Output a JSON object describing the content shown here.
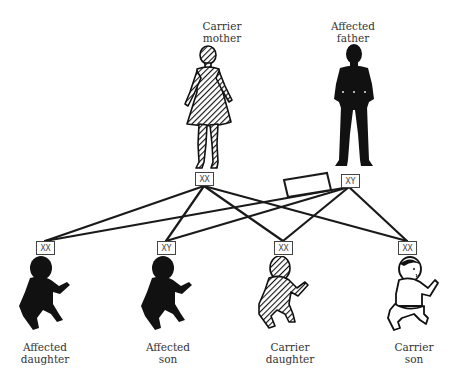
{
  "diagram": {
    "parents": [
      {
        "id": "mother",
        "label_line1": "Carrier",
        "label_line2": "mother",
        "genotype": "XX",
        "status": "carrier",
        "fill": "hatched"
      },
      {
        "id": "father",
        "label_line1": "Affected",
        "label_line2": "father",
        "genotype": "XY",
        "status": "affected",
        "fill": "solid"
      }
    ],
    "children": [
      {
        "id": "child1",
        "label_line1": "Affected",
        "label_line2": "daughter",
        "genotype": "XX",
        "status": "affected",
        "fill": "solid"
      },
      {
        "id": "child2",
        "label_line1": "Affected",
        "label_line2": "son",
        "genotype": "XY",
        "status": "affected",
        "fill": "solid"
      },
      {
        "id": "child3",
        "label_line1": "Carrier",
        "label_line2": "daughter",
        "genotype": "XX",
        "status": "carrier",
        "fill": "hatched"
      },
      {
        "id": "child4",
        "label_line1": "Carrier",
        "label_line2": "son",
        "genotype": "XX",
        "status": "carrier",
        "fill": "outline"
      }
    ],
    "connections": [
      {
        "from": "mother",
        "to": "child1"
      },
      {
        "from": "mother",
        "to": "child2"
      },
      {
        "from": "mother",
        "to": "child3"
      },
      {
        "from": "mother",
        "to": "child4"
      },
      {
        "from": "father",
        "to": "child1"
      },
      {
        "from": "father",
        "to": "child2"
      },
      {
        "from": "father",
        "to": "child3"
      },
      {
        "from": "father",
        "to": "child4"
      }
    ],
    "colors": {
      "line": "#1a1a1a",
      "figure": "#111111",
      "text": "#333333",
      "background": "#ffffff"
    }
  }
}
